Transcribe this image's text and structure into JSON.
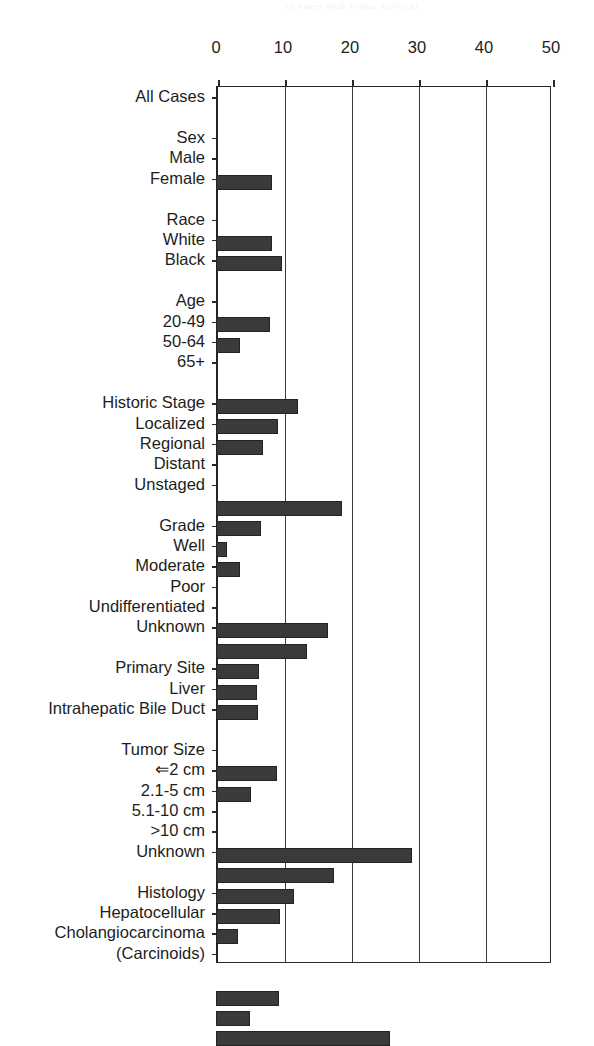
{
  "artifact": {
    "bleed_text": "of cases with 1-year survival"
  },
  "chart_data": {
    "type": "bar",
    "orientation": "horizontal",
    "title": "",
    "xlabel": "",
    "ylabel": "",
    "xlim": [
      0,
      50
    ],
    "xticks": [
      0,
      10,
      20,
      30,
      40,
      50
    ],
    "xtick_labels": [
      "0",
      "10",
      "20",
      "30",
      "40",
      "50"
    ],
    "grid": true,
    "grid_axis": "x",
    "legend": false,
    "bar_color": "#3a3a3a",
    "bar_edge_color": "#232323",
    "axis_color": "#242424",
    "background_color": "#ffffff",
    "rows": [
      {
        "label": "All Cases",
        "type": "data",
        "value": 8.4
      },
      {
        "label": "",
        "type": "spacer",
        "value": null
      },
      {
        "label": "Sex",
        "type": "header",
        "value": null
      },
      {
        "label": "Male",
        "type": "data",
        "value": 8.3
      },
      {
        "label": "Female",
        "type": "data",
        "value": 9.9
      },
      {
        "label": "",
        "type": "spacer",
        "value": null
      },
      {
        "label": "Race",
        "type": "header",
        "value": null
      },
      {
        "label": "White",
        "type": "data",
        "value": 8.1
      },
      {
        "label": "Black",
        "type": "data",
        "value": 3.6
      },
      {
        "label": "",
        "type": "spacer",
        "value": null
      },
      {
        "label": "Age",
        "type": "header",
        "value": null
      },
      {
        "label": "20-49",
        "type": "data",
        "value": 12.2
      },
      {
        "label": "50-64",
        "type": "data",
        "value": 9.2
      },
      {
        "label": "65+",
        "type": "data",
        "value": 7.0
      },
      {
        "label": "",
        "type": "spacer",
        "value": null
      },
      {
        "label": "Historic Stage",
        "type": "header",
        "value": null
      },
      {
        "label": "Localized",
        "type": "data",
        "value": 18.8
      },
      {
        "label": "Regional",
        "type": "data",
        "value": 6.7
      },
      {
        "label": "Distant",
        "type": "data",
        "value": 1.6
      },
      {
        "label": "Unstaged",
        "type": "data",
        "value": 3.6
      },
      {
        "label": "",
        "type": "spacer",
        "value": null
      },
      {
        "label": "Grade",
        "type": "header",
        "value": null
      },
      {
        "label": "Well",
        "type": "data",
        "value": 16.7
      },
      {
        "label": "Moderate",
        "type": "data",
        "value": 13.6
      },
      {
        "label": "Poor",
        "type": "data",
        "value": 6.4
      },
      {
        "label": "Undifferentiated",
        "type": "data",
        "value": 6.1
      },
      {
        "label": "Unknown",
        "type": "data",
        "value": 6.3
      },
      {
        "label": "",
        "type": "spacer",
        "value": null
      },
      {
        "label": "Primary Site",
        "type": "header",
        "value": null
      },
      {
        "label": "Liver",
        "type": "data",
        "value": 9.1
      },
      {
        "label": "Intrahepatic Bile Duct",
        "type": "data",
        "value": 5.2
      },
      {
        "label": "",
        "type": "spacer",
        "value": null
      },
      {
        "label": "Tumor Size",
        "type": "header",
        "value": null
      },
      {
        "label": "⇐2 cm",
        "type": "data",
        "value": 29.3
      },
      {
        "label": "2.1-5 cm",
        "type": "data",
        "value": 17.6
      },
      {
        "label": "5.1-10 cm",
        "type": "data",
        "value": 11.6
      },
      {
        "label": ">10 cm",
        "type": "data",
        "value": 9.5
      },
      {
        "label": "Unknown",
        "type": "data",
        "value": 3.3
      },
      {
        "label": "",
        "type": "spacer",
        "value": null
      },
      {
        "label": "Histology",
        "type": "header",
        "value": null
      },
      {
        "label": "Hepatocellular",
        "type": "data",
        "value": 9.4
      },
      {
        "label": "Cholangiocarcinoma",
        "type": "data",
        "value": 5.1
      },
      {
        "label": "(Carcinoids)",
        "type": "data",
        "value": 25.9
      }
    ]
  }
}
